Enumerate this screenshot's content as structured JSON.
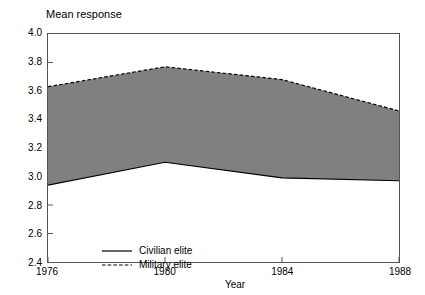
{
  "chart_data": {
    "type": "area",
    "title": "Mean response",
    "xlabel": "Year",
    "ylabel": "",
    "x": [
      1976,
      1980,
      1984,
      1988
    ],
    "categories": [
      "1976",
      "1980",
      "1984",
      "1988"
    ],
    "xlim": [
      1976,
      1988
    ],
    "ylim": [
      2.4,
      4.0
    ],
    "ytick_labels": [
      "2.4",
      "2.6",
      "2.8",
      "3.0",
      "3.2",
      "3.4",
      "3.6",
      "3.8",
      "4.0"
    ],
    "ytick_values": [
      2.4,
      2.6,
      2.8,
      3.0,
      3.2,
      3.4,
      3.6,
      3.8,
      4.0
    ],
    "xtick_labels": [
      "1976",
      "1980",
      "1984",
      "1988"
    ],
    "xtick_values": [
      1976,
      1980,
      1984,
      1988
    ],
    "grid": false,
    "legend_position": "lower left",
    "band_fill_color": "#808080",
    "line_color": "#000000",
    "series": [
      {
        "name": "Civilian elite",
        "style": "solid",
        "values": [
          2.94,
          3.1,
          2.99,
          2.97
        ]
      },
      {
        "name": "Military elite",
        "style": "dashed",
        "values": [
          3.63,
          3.77,
          3.68,
          3.46
        ]
      }
    ]
  },
  "legend": {
    "items": [
      {
        "label": "Civilian elite",
        "style": "solid"
      },
      {
        "label": "Military elite",
        "style": "dashed"
      }
    ]
  }
}
